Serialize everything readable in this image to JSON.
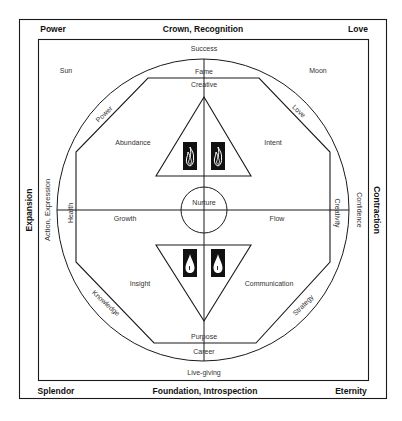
{
  "corners": {
    "top_left": "Power",
    "top_right": "Love",
    "bottom_left": "Splendor",
    "bottom_right": "Eternity"
  },
  "sides": {
    "top": "Crown, Recognition",
    "bottom": "Foundation, Introspection",
    "left": "Expansion",
    "right": "Contraction"
  },
  "inner_frame": {
    "top": "Success",
    "bottom": "Live-giving",
    "left": "Action, Expression",
    "right": "Confidence",
    "top_left": "Sun",
    "top_right": "Moon"
  },
  "circle_band": {
    "top": "Fame",
    "bottom": "Career",
    "left": "Health",
    "right": "Creativity",
    "upper_left": "Power",
    "upper_right": "Love",
    "lower_left": "Knowledge",
    "lower_right": "Strategy"
  },
  "octagon": {
    "top": "Creative",
    "bottom": "Purpose"
  },
  "quadrants": {
    "upper_left": "Abundance",
    "upper_right": "Intent",
    "lower_left": "Insight",
    "lower_right": "Communication",
    "left": "Growth",
    "right": "Flow"
  },
  "center": "Nurture",
  "symbols": {
    "upper_triangle": [
      "fire-icon",
      "fire-icon"
    ],
    "lower_triangle": [
      "water-drop-icon",
      "water-drop-icon"
    ]
  },
  "colors": {
    "line": "#1a1a1a",
    "background": "#ffffff",
    "symbol_fill": "#111111"
  }
}
